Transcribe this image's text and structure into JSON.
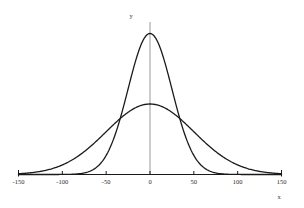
{
  "chart_data": {
    "type": "line",
    "title": "",
    "subtitle": "",
    "xlabel": "x",
    "ylabel": "y",
    "xlim": [
      -150,
      150
    ],
    "ylim": [
      0,
      1
    ],
    "grid": false,
    "legend": false,
    "legend_position": "none",
    "background_color": "#ffffff",
    "curve_color": "#1a1a1a",
    "xaxis_color": "#1a1a1a",
    "yaxis_color": "#808080",
    "xticks": [
      -150,
      -100,
      -50,
      0,
      50,
      100,
      150
    ],
    "xtick_labels": [
      "-150",
      "-100",
      "-50",
      "0",
      "50",
      "100",
      "150"
    ],
    "yticks": [],
    "ytick_labels": [],
    "annotations": [],
    "series": [
      {
        "name": "narrow-normal",
        "mean": 0,
        "sigma": 25,
        "peak_value": 1.0,
        "x": [
          -150,
          -140,
          -130,
          -120,
          -110,
          -100,
          -90,
          -80,
          -70,
          -60,
          -50,
          -45,
          -40,
          -35,
          -30,
          -25,
          -20,
          -15,
          -10,
          -5,
          0,
          5,
          10,
          15,
          20,
          25,
          30,
          35,
          40,
          45,
          50,
          60,
          70,
          80,
          90,
          100,
          110,
          120,
          130,
          140,
          150
        ],
        "values": [
          0.0,
          0.0,
          0.0,
          0.0,
          0.0,
          0.0003,
          0.0012,
          0.0077,
          0.0198,
          0.0561,
          0.1353,
          0.1979,
          0.278,
          0.3753,
          0.4868,
          0.6065,
          0.7261,
          0.8353,
          0.9231,
          0.9802,
          1.0,
          0.9802,
          0.9231,
          0.8353,
          0.7261,
          0.6065,
          0.4868,
          0.3753,
          0.278,
          0.1979,
          0.1353,
          0.0561,
          0.0198,
          0.0077,
          0.0012,
          0.0003,
          0.0,
          0.0,
          0.0,
          0.0,
          0.0
        ]
      },
      {
        "name": "wide-normal",
        "mean": 0,
        "sigma": 50,
        "peak_value": 0.5,
        "x": [
          -150,
          -140,
          -130,
          -120,
          -110,
          -100,
          -90,
          -80,
          -70,
          -60,
          -50,
          -45,
          -40,
          -35,
          -30,
          -25,
          -20,
          -15,
          -10,
          -5,
          0,
          5,
          10,
          15,
          20,
          25,
          30,
          35,
          40,
          45,
          50,
          60,
          70,
          80,
          90,
          100,
          110,
          120,
          130,
          140,
          150
        ],
        "values": [
          0.0055,
          0.0106,
          0.0192,
          0.0326,
          0.0523,
          0.0677,
          0.099,
          0.1385,
          0.1851,
          0.2369,
          0.2919,
          0.3198,
          0.3474,
          0.374,
          0.3991,
          0.4222,
          0.4429,
          0.4606,
          0.4752,
          0.4863,
          0.5,
          0.4863,
          0.4752,
          0.4606,
          0.4429,
          0.4222,
          0.3991,
          0.374,
          0.3474,
          0.3198,
          0.2919,
          0.2369,
          0.1851,
          0.1385,
          0.099,
          0.0677,
          0.0523,
          0.0326,
          0.0192,
          0.0106,
          0.0055
        ]
      }
    ],
    "intersections": [
      {
        "x": -41,
        "y": 0.265
      },
      {
        "x": 41,
        "y": 0.265
      }
    ]
  },
  "axis_labels": {
    "x": "x",
    "y": "y"
  }
}
